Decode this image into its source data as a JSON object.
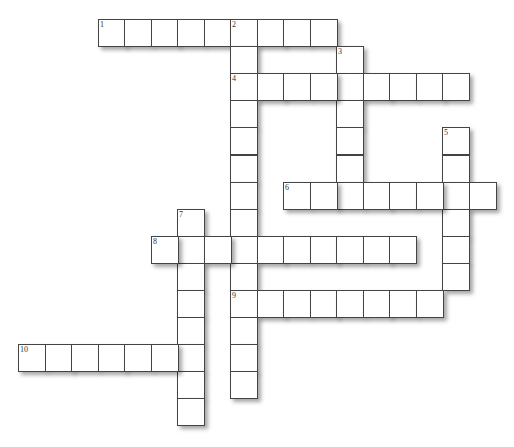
{
  "puzzle": {
    "grid": {
      "origin_x": 18,
      "origin_y": 19,
      "cell_w": 26.5,
      "cell_h": 27.1
    },
    "entries": [
      {
        "number": "1",
        "direction": "across",
        "row": 0,
        "col": 3,
        "length": 9
      },
      {
        "number": "2",
        "direction": "down",
        "row": 0,
        "col": 8,
        "length": 14
      },
      {
        "number": "3",
        "direction": "down",
        "row": 1,
        "col": 12,
        "length": 6
      },
      {
        "number": "4",
        "direction": "across",
        "row": 2,
        "col": 8,
        "length": 9
      },
      {
        "number": "5",
        "direction": "down",
        "row": 4,
        "col": 16,
        "length": 6
      },
      {
        "number": "6",
        "direction": "across",
        "row": 6,
        "col": 10,
        "length": 8
      },
      {
        "number": "7",
        "direction": "down",
        "row": 7,
        "col": 6,
        "length": 8
      },
      {
        "number": "8",
        "direction": "across",
        "row": 8,
        "col": 5,
        "length": 10
      },
      {
        "number": "9",
        "direction": "across",
        "row": 10,
        "col": 8,
        "length": 8
      },
      {
        "number": "10",
        "direction": "across",
        "row": 12,
        "col": 0,
        "length": 7
      }
    ]
  }
}
